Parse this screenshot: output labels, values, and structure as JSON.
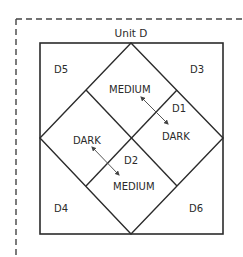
{
  "title": "Unit D",
  "colors": {
    "line": "#2b2b2b",
    "arrow": "#555555",
    "dash": "#444444",
    "background": "#ffffff"
  },
  "frame": {
    "style": "dashed",
    "top_y": 19,
    "left_x": 16
  },
  "outer_square": {
    "x1": 40,
    "y1": 43,
    "x2": 223,
    "y2": 234
  },
  "diamond": {
    "top": [
      131,
      43
    ],
    "right": [
      223,
      138
    ],
    "bottom": [
      131,
      234
    ],
    "left": [
      40,
      138
    ]
  },
  "divider_lines": [
    {
      "from": [
        86,
        90
      ],
      "to": [
        177,
        186
      ]
    },
    {
      "from": [
        177,
        90
      ],
      "to": [
        86,
        186
      ]
    }
  ],
  "regions": {
    "d5": {
      "label": "D5",
      "x": 54,
      "y": 73
    },
    "d3": {
      "label": "D3",
      "x": 190,
      "y": 73
    },
    "d4": {
      "label": "D4",
      "x": 54,
      "y": 212
    },
    "d6": {
      "label": "D6",
      "x": 189,
      "y": 212
    },
    "d1": {
      "label": "D1",
      "x": 172,
      "y": 112
    },
    "d2": {
      "label": "D2",
      "x": 124,
      "y": 164
    }
  },
  "shades": {
    "top_medium": {
      "label": "MEDIUM",
      "x": 109,
      "y": 93
    },
    "right_dark": {
      "label": "DARK",
      "x": 162,
      "y": 140
    },
    "left_dark": {
      "label": "DARK",
      "x": 73,
      "y": 144
    },
    "bottom_medium": {
      "label": "MEDIUM",
      "x": 113,
      "y": 190
    }
  },
  "arrows": [
    {
      "name": "medium-to-dark-arrow-d1",
      "from": [
        142,
        98
      ],
      "to": [
        167,
        123
      ]
    },
    {
      "name": "dark-to-medium-arrow-d2",
      "from": [
        93,
        148
      ],
      "to": [
        118,
        174
      ]
    }
  ]
}
